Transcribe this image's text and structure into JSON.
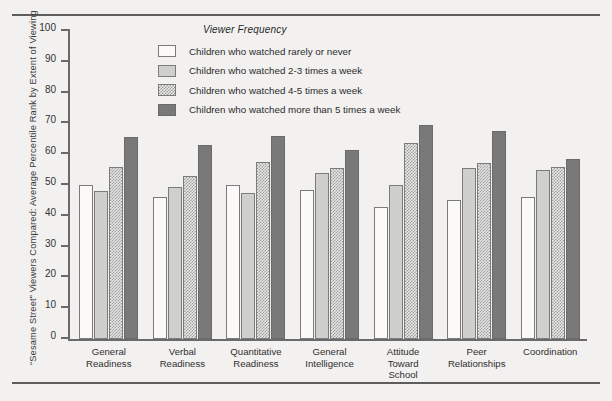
{
  "chart_data": {
    "type": "bar",
    "title": "",
    "xlabel": "",
    "ylabel": "“Sesame Street” Viewers Compared: Average Percentile Rank by Extent of Viewing",
    "ylim": [
      0,
      100
    ],
    "yticks": [
      0,
      10,
      20,
      30,
      40,
      50,
      60,
      70,
      80,
      90,
      100
    ],
    "grid": false,
    "legend_position": "top-center",
    "legend_title": "Viewer Frequency",
    "categories": [
      "General Readiness",
      "Verbal Readiness",
      "Quantitative Readiness",
      "General Intelligence",
      "Attitude Toward School",
      "Peer Relationships",
      "Coordination"
    ],
    "series": [
      {
        "name": "Children who watched rarely or never",
        "color": "#fbfaf8",
        "values": [
          50,
          46,
          50,
          48.5,
          43,
          45,
          46
        ]
      },
      {
        "name": "Children who watched 2-3 times a week",
        "color": "#cfcfcd",
        "values": [
          48,
          49.5,
          47.5,
          54,
          50,
          55.5,
          55
        ]
      },
      {
        "name": "Children who watched 4-5 times a week",
        "color": "#b8b8b6",
        "values": [
          56,
          53,
          57.5,
          55.5,
          63.5,
          57,
          56
        ]
      },
      {
        "name": "Children who watched more than 5 times a week",
        "color": "#797979",
        "values": [
          65.5,
          63,
          66,
          61.5,
          69.5,
          67.5,
          58.5
        ]
      }
    ]
  },
  "axis": {
    "tick_labels": [
      "100",
      "90",
      "80",
      "70",
      "60",
      "50",
      "40",
      "30",
      "20",
      "10",
      "0"
    ],
    "y_title": "“Sesame Street” Viewers Compared: Average Percentile Rank by Extent of Viewing"
  },
  "categories_display": [
    [
      "General",
      "Readiness"
    ],
    [
      "Verbal",
      "Readiness"
    ],
    [
      "Quantitative",
      "Readiness"
    ],
    [
      "General",
      "Intelligence"
    ],
    [
      "Attitude",
      "Toward",
      "School"
    ],
    [
      "Peer",
      "Relationships"
    ],
    [
      "Coordination"
    ]
  ],
  "legend": {
    "title": "Viewer Frequency",
    "items": [
      {
        "label": "Children who watched rarely or never",
        "swatch": "swatch-white"
      },
      {
        "label": "Children who watched 2-3 times a week",
        "swatch": "swatch-light-gray"
      },
      {
        "label": "Children who watched 4-5 times a week",
        "swatch": "swatch-checkered"
      },
      {
        "label": "Children who watched more than 5 times a week",
        "swatch": "swatch-dark-gray"
      }
    ]
  }
}
